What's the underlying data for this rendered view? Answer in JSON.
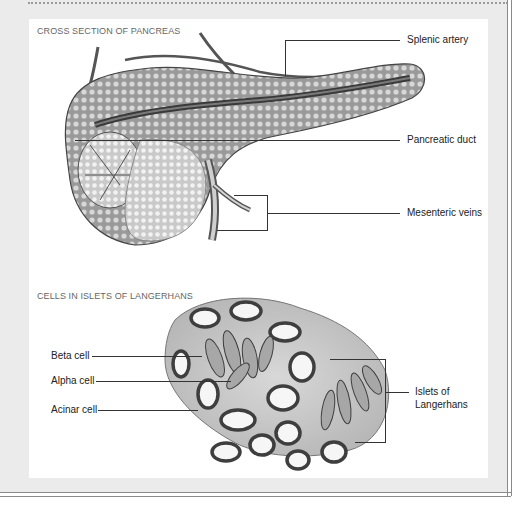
{
  "sections": [
    {
      "title": "CROSS SECTION OF PANCREAS",
      "labels": [
        "Splenic artery",
        "Pancreatic duct",
        "Mesenteric veins"
      ]
    },
    {
      "title": "CELLS IN ISLETS OF LANGERHANS",
      "labels_left": [
        "Beta cell",
        "Alpha cell",
        "Acinar cell"
      ],
      "label_right": [
        "Islets of",
        "Langerhans"
      ]
    }
  ],
  "colors": {
    "frame_bg": "#ebebeb",
    "panel_bg": "#ffffff",
    "tissue": "#8a8a8a",
    "leader": "#333333"
  }
}
